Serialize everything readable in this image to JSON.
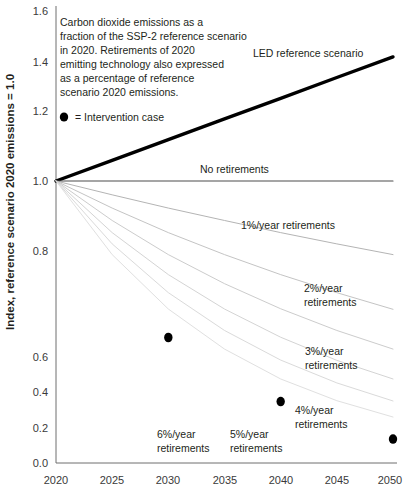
{
  "chart_data": {
    "type": "line",
    "title": "",
    "xlabel": "",
    "ylabel": "Index, reference scenario 2020 emissions = 1.0",
    "xlim": [
      2020,
      2050
    ],
    "ylim": [
      0.0,
      1.6
    ],
    "xticks": [
      "2020",
      "2025",
      "2030",
      "2035",
      "2040",
      "2045",
      "2050"
    ],
    "yticks": [
      "0.0",
      "0.2",
      "0.4",
      "0.6",
      "0.8",
      "1.0",
      "1.2",
      "1.4",
      "1.6"
    ],
    "grid": false,
    "legend_position": "inline-annotations",
    "x": [
      2020,
      2025,
      2030,
      2035,
      2040,
      2045,
      2050
    ],
    "series": [
      {
        "name": "LED reference scenario",
        "label": "LED reference scenario",
        "values": [
          1.0,
          1.073,
          1.147,
          1.22,
          1.293,
          1.367,
          1.44
        ],
        "color": "#000000",
        "width": 3.4
      },
      {
        "name": "No retirements",
        "label": "No retirements",
        "values": [
          1.0,
          1.0,
          1.0,
          1.0,
          1.0,
          1.0,
          1.0
        ],
        "color": "#4d4d4d",
        "width": 1.1
      },
      {
        "name": "1%/year retirements",
        "label": "1%/year retirements",
        "values": [
          1.0,
          0.951,
          0.904,
          0.86,
          0.817,
          0.777,
          0.739
        ],
        "color": "#b4b4b4",
        "width": 1.0
      },
      {
        "name": "2%/year retirements",
        "label": "2%/year retirements",
        "values": [
          1.0,
          0.904,
          0.817,
          0.739,
          0.668,
          0.604,
          0.545
        ],
        "color": "#c4c4c4",
        "width": 1.0
      },
      {
        "name": "3%/year retirements",
        "label": "3%/year retirements",
        "values": [
          1.0,
          0.86,
          0.739,
          0.636,
          0.547,
          0.47,
          0.404
        ],
        "color": "#cccccc",
        "width": 1.0
      },
      {
        "name": "4%/year retirements",
        "label": "4%/year retirements",
        "values": [
          1.0,
          0.817,
          0.668,
          0.546,
          0.446,
          0.364,
          0.298
        ],
        "color": "#d4d4d4",
        "width": 1.0
      },
      {
        "name": "5%/year retirements",
        "label": "5%/year retirements",
        "values": [
          1.0,
          0.777,
          0.604,
          0.47,
          0.365,
          0.284,
          0.22
        ],
        "color": "#dadada",
        "width": 1.0
      },
      {
        "name": "6%/year retirements",
        "label": "6%/year retirements",
        "values": [
          1.0,
          0.739,
          0.546,
          0.404,
          0.298,
          0.221,
          0.163
        ],
        "color": "#e0e0e0",
        "width": 1.0
      }
    ],
    "intervention_points": {
      "label": "= Intervention case",
      "x": [
        2030,
        2040,
        2050
      ],
      "values": [
        0.445,
        0.218,
        0.085
      ],
      "color": "#000000"
    },
    "annotations": {
      "note": "Carbon dioxide emissions as a fraction of the SSP-2 reference scenario in 2020.  Retirements of 2020 emitting technology also expressed as a percentage of reference scenario 2020 emissions.",
      "note_lines": [
        "Carbon dioxide emissions as a",
        "fraction of the SSP-2 reference scenario",
        "in 2020.  Retirements of 2020",
        "emitting technology also expressed",
        "as a percentage of reference",
        "scenario 2020 emissions."
      ],
      "legend_text": "= Intervention case",
      "led_label": "LED reference scenario",
      "no_retire_label": "No retirements",
      "pct1_label": "1%/year retirements",
      "pct2_line1": "2%/year",
      "pct2_line2": "retirements",
      "pct3_line1": "3%/year",
      "pct3_line2": "retirements",
      "pct4_line1": "4%/year",
      "pct4_line2": "retirements",
      "pct5_line1": "5%/year",
      "pct5_line2": "retirements",
      "pct6_line1": "6%/year",
      "pct6_line2": "retirements"
    }
  }
}
